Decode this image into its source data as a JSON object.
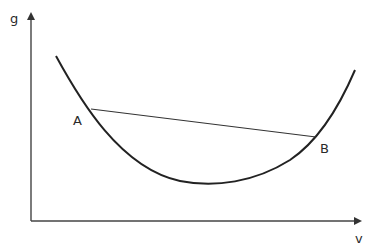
{
  "diagram": {
    "axes": {
      "y_label": "g",
      "x_label": "v"
    },
    "points": [
      {
        "label": "A"
      },
      {
        "label": "B"
      }
    ],
    "colors": {
      "curve": "#222222",
      "axis": "#444444",
      "chord": "#333333",
      "background": "#ffffff"
    }
  }
}
